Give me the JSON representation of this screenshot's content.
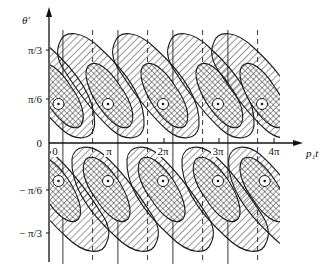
{
  "figure": {
    "y_axis_label": "θ′",
    "x_axis_label": "p₁t",
    "y_ticks": [
      {
        "label": "π/3",
        "value": 1.0472
      },
      {
        "label": "π/6",
        "value": 0.5236
      },
      {
        "label": "0",
        "value": 0
      },
      {
        "label": "− π/6",
        "value": -0.5236
      },
      {
        "label": "− π/3",
        "value": -1.0472
      }
    ],
    "x_ticks": [
      {
        "label": "0",
        "value": 0
      },
      {
        "label": "π",
        "value": 1
      },
      {
        "label": "2π",
        "value": 2
      },
      {
        "label": "3π",
        "value": 3
      },
      {
        "label": "4π",
        "value": 4
      }
    ],
    "x_range_pi": [
      -0.08,
      4.5
    ],
    "y_range_pi6": [
      -2.3,
      2.6
    ],
    "solid_lines_pi": [
      0.18,
      1.18,
      2.18,
      3.18
    ],
    "dashed_lines_pi": [
      0.72,
      1.72,
      2.72,
      3.72
    ],
    "upper_lobe_centers_pi": [
      0.1,
      1.0,
      2.0,
      3.0,
      3.8
    ],
    "lower_lobe_centers_pi": [
      0.1,
      1.0,
      2.0,
      3.0,
      3.85
    ],
    "colors": {
      "ink": "#1a1a1a",
      "background": "#ffffff"
    }
  }
}
